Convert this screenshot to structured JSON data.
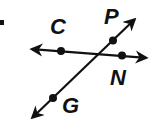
{
  "diagram": {
    "colors": {
      "line": "#111111",
      "background": "#ffffff"
    },
    "lines": [
      {
        "id": "line-CN",
        "from": [
          29,
          49
        ],
        "to": [
          149,
          58
        ],
        "arrows": "both",
        "points": [
          "C",
          "N"
        ]
      },
      {
        "id": "line-GP",
        "from": [
          30,
          120
        ],
        "to": [
          137,
          17
        ],
        "arrows": "both",
        "points": [
          "G",
          "P"
        ]
      }
    ],
    "points": [
      {
        "name": "C",
        "x": 61,
        "y": 51
      },
      {
        "name": "N",
        "x": 122,
        "y": 55
      },
      {
        "name": "P",
        "x": 113,
        "y": 41
      },
      {
        "name": "G",
        "x": 53,
        "y": 98
      }
    ],
    "labels": {
      "C": "C",
      "N": "N",
      "P": "P",
      "G": "G"
    }
  }
}
